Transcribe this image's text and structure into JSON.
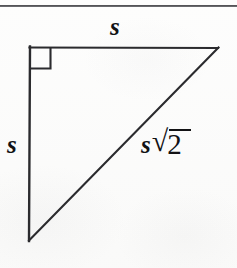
{
  "figure": {
    "name": "right-triangle-45-45-90",
    "background_color": "#fbfbfa",
    "stroke_color": "#2b2b2e",
    "text_color": "#121214"
  },
  "page_rule": {
    "present": "true",
    "color": "#3e3e41"
  },
  "labels": {
    "top_leg": "s",
    "left_leg": "s",
    "hypotenuse_variable": "s",
    "radical_sign": "√",
    "radicand": "2"
  },
  "geometry": {
    "vertices": {
      "top_left": [
        30,
        47
      ],
      "top_right": [
        218,
        48
      ],
      "bottom_left": [
        29,
        240
      ]
    },
    "right_angle_marker": {
      "at_vertex": "top_left",
      "size": 21
    }
  }
}
